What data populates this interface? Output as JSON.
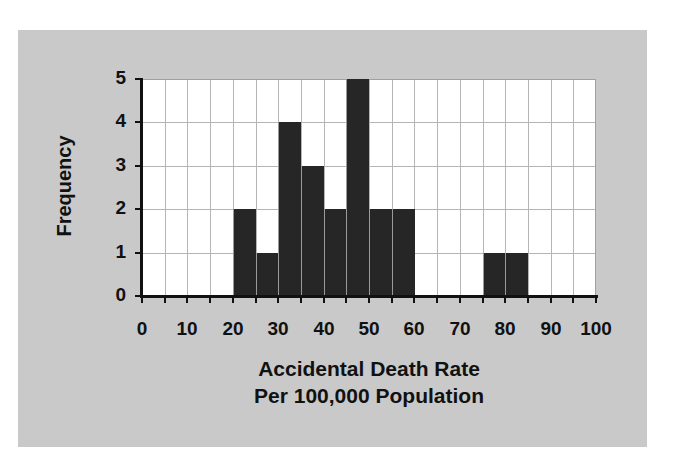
{
  "chart_data": {
    "type": "bar",
    "subtype": "histogram",
    "title": "",
    "xlabel": "Accidental Death Rate Per 100,000 Population",
    "xlabel_lines": [
      "Accidental Death Rate",
      "Per 100,000 Population"
    ],
    "ylabel": "Frequency",
    "bin_width": 5,
    "bin_edges": [
      0,
      5,
      10,
      15,
      20,
      25,
      30,
      35,
      40,
      45,
      50,
      55,
      60,
      65,
      70,
      75,
      80,
      85,
      90,
      95,
      100
    ],
    "categories": [
      "0-5",
      "5-10",
      "10-15",
      "15-20",
      "20-25",
      "25-30",
      "30-35",
      "35-40",
      "40-45",
      "45-50",
      "50-55",
      "55-60",
      "60-65",
      "65-70",
      "70-75",
      "75-80",
      "80-85",
      "85-90",
      "90-95",
      "95-100"
    ],
    "values": [
      0,
      0,
      0,
      0,
      2,
      1,
      4,
      3,
      2,
      5,
      2,
      2,
      0,
      0,
      0,
      1,
      1,
      0,
      0,
      0
    ],
    "xlim": [
      0,
      100
    ],
    "ylim": [
      0,
      5
    ],
    "x_tick_labels": [
      "0",
      "10",
      "20",
      "30",
      "40",
      "50",
      "60",
      "70",
      "80",
      "90",
      "100"
    ],
    "y_tick_labels": [
      "0",
      "1",
      "2",
      "3",
      "4",
      "5"
    ],
    "grid": true,
    "legend": null,
    "colors": {
      "bar": "#262626",
      "plot_bg": "#ffffff",
      "panel_bg": "#c9c9c9",
      "grid": "#b5b5b5"
    }
  }
}
